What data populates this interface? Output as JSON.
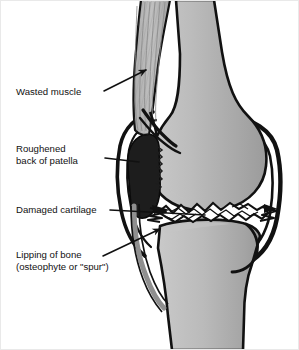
{
  "figure": {
    "type": "anatomical-cross-section",
    "view": "lateral (side) view of right knee",
    "background_color": "#ffffff",
    "border_color": "#e9e9e9"
  },
  "palette": {
    "bone_light": "#cfcfcf",
    "bone_mid": "#b4b4b4",
    "bone_dark": "#9a9a9a",
    "outline": "#111111",
    "patella_fill": "#1d1d1d",
    "muscle_fill": "#b8b8b8",
    "muscle_stripe": "#8e8e8e",
    "cartilage_fill": "#ffffff",
    "capsule_stroke": "#111111",
    "text_color": "#111111",
    "leader_color": "#111111"
  },
  "labels": [
    {
      "id": "wasted-muscle",
      "lines": [
        "Wasted muscle"
      ],
      "text_x": 16,
      "text_y": 95,
      "leader": {
        "x1": 104,
        "y1": 91,
        "x2": 146,
        "y2": 70
      },
      "arrowhead": true,
      "points_to": "quadriceps muscle (atrophied)"
    },
    {
      "id": "roughened-back-of-patella",
      "lines": [
        "Roughened",
        "back of patella"
      ],
      "text_x": 16,
      "text_y": 152,
      "leader": {
        "x1": 105,
        "y1": 158,
        "x2": 139,
        "y2": 162
      },
      "arrowhead": false,
      "points_to": "posterior surface of kneecap"
    },
    {
      "id": "damaged-cartilage",
      "lines": [
        "Damaged cartilage"
      ],
      "text_x": 16,
      "text_y": 213,
      "leader": {
        "x1": 110,
        "y1": 210,
        "x2": 205,
        "y2": 215
      },
      "arrowhead": false,
      "points_to": "articular cartilage between femur and tibia"
    },
    {
      "id": "lipping-of-bone",
      "lines": [
        "Lipping of bone",
        "(osteophyte or \"spur\")"
      ],
      "text_x": 16,
      "text_y": 258,
      "leader": {
        "x1": 103,
        "y1": 256,
        "x2": 160,
        "y2": 229
      },
      "arrowhead": true,
      "points_to": "bone spur at joint margin"
    }
  ],
  "structures": [
    {
      "id": "femur",
      "name": "Femur (thigh bone)"
    },
    {
      "id": "femoral-condyle",
      "name": "Femoral condyle"
    },
    {
      "id": "tibia",
      "name": "Tibia (shin bone)"
    },
    {
      "id": "patella",
      "name": "Patella (kneecap)"
    },
    {
      "id": "quadriceps",
      "name": "Quadriceps muscle"
    },
    {
      "id": "patellar-tendon",
      "name": "Patellar tendon"
    },
    {
      "id": "joint-capsule",
      "name": "Joint capsule"
    },
    {
      "id": "damaged-cartilage",
      "name": "Damaged cartilage"
    },
    {
      "id": "osteophyte",
      "name": "Osteophyte / bone spur"
    }
  ]
}
